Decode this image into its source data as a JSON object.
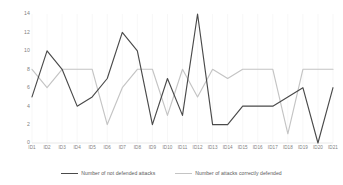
{
  "chart_data": {
    "type": "line",
    "title": "",
    "xlabel": "",
    "ylabel": "",
    "ylim": [
      0,
      14
    ],
    "yticks": [
      0,
      2,
      4,
      6,
      8,
      10,
      12,
      14
    ],
    "grid": false,
    "legend_position": "bottom",
    "categories": [
      "ID1",
      "ID2",
      "ID3",
      "ID4",
      "ID5",
      "ID6",
      "ID7",
      "ID8",
      "ID9",
      "ID10",
      "ID11",
      "ID12",
      "ID13",
      "ID14",
      "ID15",
      "ID16",
      "ID17",
      "ID18",
      "ID19",
      "ID20",
      "ID21"
    ],
    "series": [
      {
        "name": "Number of not defended attacks",
        "color": "#4a4a4a",
        "values": [
          5,
          10,
          8,
          4,
          5,
          7,
          12,
          10,
          2,
          7,
          3,
          14,
          2,
          2,
          4,
          4,
          4,
          5,
          6,
          0,
          6
        ]
      },
      {
        "name": "Number of attacks correctly defended",
        "color": "#c4c4c4",
        "values": [
          8,
          6,
          8,
          8,
          8,
          2,
          6,
          8,
          8,
          3,
          8,
          5,
          8,
          7,
          8,
          8,
          8,
          1,
          8,
          8,
          8
        ]
      }
    ]
  },
  "legend": {
    "entries": [
      {
        "label": "Number of not defended attacks",
        "color": "#4a4a4a"
      },
      {
        "label": "Number of attacks correctly defended",
        "color": "#c4c4c4"
      }
    ]
  }
}
